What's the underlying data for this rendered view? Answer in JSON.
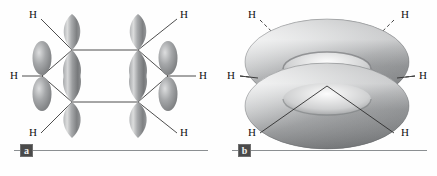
{
  "figure": {
    "background_color": "#fefefe"
  },
  "palette": {
    "orbital_dark": "#6f7173",
    "orbital_mid": "#9a9c9e",
    "orbital_light": "#cfd1d2",
    "orbital_highlight": "#e8e9ea",
    "bond_line": "#3a3a3a",
    "rule_line": "#8b8f92",
    "badge_bg": "#4a4a4a",
    "badge_text": "#f2f2f2",
    "label_text": "#111111"
  },
  "panel_a": {
    "badge": "a",
    "caption_present": true,
    "description": "Six unhybridized p orbitals on the hexagonal carbon skeleton of benzene",
    "hydrogen_labels": [
      {
        "id": "h-top-left",
        "text": "H",
        "x": 29,
        "y": 9
      },
      {
        "id": "h-mid-left",
        "text": "H",
        "x": 10,
        "y": 70
      },
      {
        "id": "h-bottom-left",
        "text": "H",
        "x": 29,
        "y": 127
      },
      {
        "id": "h-top-right",
        "text": "H",
        "x": 180,
        "y": 9
      },
      {
        "id": "h-mid-right",
        "text": "H",
        "x": 199,
        "y": 70
      },
      {
        "id": "h-bottom-right",
        "text": "H",
        "x": 180,
        "y": 127
      }
    ],
    "carbon_vertices": [
      {
        "id": "c1",
        "x": 72,
        "y": 50
      },
      {
        "id": "c2",
        "x": 138,
        "y": 50
      },
      {
        "id": "c3",
        "x": 168,
        "y": 76
      },
      {
        "id": "c4",
        "x": 138,
        "y": 102
      },
      {
        "id": "c5",
        "x": 72,
        "y": 102
      },
      {
        "id": "c6",
        "x": 42,
        "y": 76
      }
    ],
    "ring_bonds": [
      {
        "from": "c1",
        "to": "c2"
      },
      {
        "from": "c2",
        "to": "c3"
      },
      {
        "from": "c3",
        "to": "c4"
      },
      {
        "from": "c4",
        "to": "c5"
      },
      {
        "from": "c5",
        "to": "c6"
      },
      {
        "from": "c6",
        "to": "c1"
      }
    ],
    "ch_bonds": [
      {
        "from": "c1",
        "to_label": "h-top-left"
      },
      {
        "from": "c2",
        "to_label": "h-top-right"
      },
      {
        "from": "c3",
        "to_label": "h-mid-right"
      },
      {
        "from": "c4",
        "to_label": "h-bottom-right"
      },
      {
        "from": "c5",
        "to_label": "h-bottom-left"
      },
      {
        "from": "c6",
        "to_label": "h-mid-left"
      }
    ],
    "p_orbital_count": 6
  },
  "panel_b": {
    "badge": "b",
    "caption_present": true,
    "description": "Delocalized pi electron cloud shown as two doughnut shaped lobes above and below the ring plane",
    "torus_count": 2,
    "hydrogen_labels": [
      {
        "id": "h-top-left",
        "text": "H",
        "x": 30,
        "y": 9
      },
      {
        "id": "h-mid-left",
        "text": "H",
        "x": 9,
        "y": 70
      },
      {
        "id": "h-bottom-left",
        "text": "H",
        "x": 30,
        "y": 127
      },
      {
        "id": "h-top-right",
        "text": "H",
        "x": 183,
        "y": 9
      },
      {
        "id": "h-mid-right",
        "text": "H",
        "x": 201,
        "y": 70
      },
      {
        "id": "h-bottom-right",
        "text": "H",
        "x": 183,
        "y": 127
      }
    ],
    "bond_styles": {
      "upper_bonds": "dashed",
      "lower_bonds": "solid"
    }
  }
}
